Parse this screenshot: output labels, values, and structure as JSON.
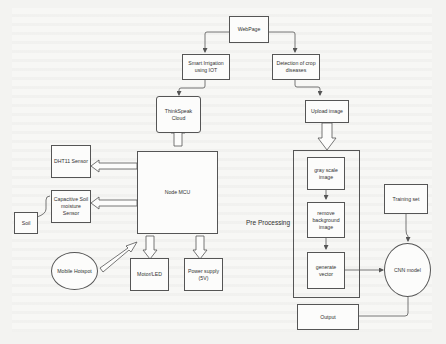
{
  "diagram": {
    "colors": {
      "line": "#555555",
      "box_fill": "#fcfcfb",
      "background": "#f7f7f5",
      "text": "#333333"
    },
    "nodes": {
      "webpage": "WebPage",
      "smart_irrigation": "Smart Irrigation using IOT",
      "crop_disease": "Detection of crop diseases",
      "thingspeak": "ThinkSpeak Cloud",
      "node_mcu": "Node MCU",
      "dht11": "DHT11 Sensor",
      "soil_sensor": "Capacitive Soil moisture Sensor",
      "soil": "Soil",
      "mobile_hotspot": "Mobile Hotspot",
      "motor_led": "Motor/LED",
      "power_supply": "Power supply (5V)",
      "upload_image": "Upload image",
      "gray_scale": "gray scale image",
      "remove_bg": "remove background image",
      "generate_vector": "generate vector",
      "training_set": "Training set",
      "cnn_model": "CNN model",
      "output": "Output"
    },
    "labels": {
      "pre_processing": "Pre Processing"
    },
    "edges": [
      {
        "from": "WebPage",
        "to": "Smart Irrigation using IOT",
        "style": "thin-arrow"
      },
      {
        "from": "WebPage",
        "to": "Detection of crop diseases",
        "style": "thin-arrow"
      },
      {
        "from": "Smart Irrigation using IOT",
        "to": "ThinkSpeak Cloud",
        "style": "thin-arrow"
      },
      {
        "from": "Node MCU",
        "to": "ThinkSpeak Cloud",
        "style": "block-arrow"
      },
      {
        "from": "Node MCU",
        "to": "DHT11 Sensor",
        "style": "block-arrow"
      },
      {
        "from": "Node MCU",
        "to": "Capacitive Soil moisture Sensor",
        "style": "block-arrow"
      },
      {
        "from": "Soil",
        "to": "Capacitive Soil moisture Sensor",
        "style": "line"
      },
      {
        "from": "Mobile Hotspot",
        "to": "Node MCU",
        "style": "block-arrow"
      },
      {
        "from": "Node MCU",
        "to": "Motor/LED",
        "style": "block-arrow"
      },
      {
        "from": "Node MCU",
        "to": "Power supply (5V)",
        "style": "block-arrow"
      },
      {
        "from": "Detection of crop diseases",
        "to": "Upload image",
        "style": "thin-arrow"
      },
      {
        "from": "Upload image",
        "to": "Pre Processing",
        "style": "block-arrow"
      },
      {
        "from": "gray scale image",
        "to": "remove background image",
        "style": "thin-arrow"
      },
      {
        "from": "remove background image",
        "to": "generate vector",
        "style": "thin-arrow"
      },
      {
        "from": "generate vector",
        "to": "CNN model",
        "style": "thin-arrow"
      },
      {
        "from": "Training set",
        "to": "CNN model",
        "style": "thin-arrow"
      },
      {
        "from": "CNN model",
        "to": "Output",
        "style": "line"
      }
    ]
  }
}
